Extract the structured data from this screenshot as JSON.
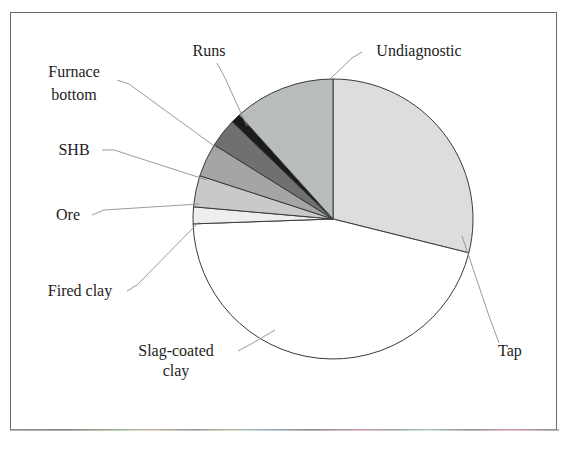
{
  "figure": {
    "border_color": "#6b6b6b",
    "background": "#ffffff"
  },
  "chart_data": {
    "type": "pie",
    "title": "",
    "subtitle": "",
    "xlabel": "",
    "ylabel": "",
    "legend_position": "none",
    "grid": false,
    "labels_outside": true,
    "center": {
      "x": 333,
      "y": 219
    },
    "radius": 140,
    "start_angle_deg": 0,
    "direction": "clockwise",
    "categories": [
      "Tap",
      "Slag-coated clay",
      "Fired clay",
      "Ore",
      "SHB",
      "Furnace bottom",
      "Runs",
      "Undiagnostic"
    ],
    "values": [
      28.9,
      45.6,
      1.9,
      3.6,
      3.9,
      3.3,
      1.1,
      11.7
    ],
    "value_unit": "percent",
    "slices": [
      {
        "label": "Tap",
        "value": 28.9,
        "start_deg": 0,
        "end_deg": 104,
        "color": "#dcdddd",
        "label_x": 510,
        "label_y": 356,
        "label_anchor": "middle",
        "leader": "M 499 343 L 489 316 L 462 236"
      },
      {
        "label": "Slag-coated clay",
        "value": 45.6,
        "start_deg": 104,
        "end_deg": 268,
        "color": "#ffffff",
        "label_x": 176,
        "label_y": 356,
        "label_anchor": "middle",
        "label_line2": "clay",
        "label2_x": 176,
        "label2_y": 376,
        "leader": "M 238 351 L 251 344 L 275 330"
      },
      {
        "label": "Fired clay",
        "value": 1.9,
        "start_deg": 268,
        "end_deg": 275,
        "color": "#eeeeee",
        "label_x": 80,
        "label_y": 296,
        "label_anchor": "middle",
        "leader": "M 127 291 L 137 285 L 199 222"
      },
      {
        "label": "Ore",
        "value": 3.6,
        "start_deg": 275,
        "end_deg": 288,
        "color": "#c8c9c9",
        "label_x": 68,
        "label_y": 220,
        "label_anchor": "middle",
        "leader": "M 92 215 L 104 210 L 199 204"
      },
      {
        "label": "SHB",
        "value": 3.9,
        "start_deg": 288,
        "end_deg": 302,
        "color": "#a3a5a6",
        "label_x": 74,
        "label_y": 155,
        "label_anchor": "middle",
        "leader": "M 102 150 L 114 150 L 207 180"
      },
      {
        "label": "Furnace bottom",
        "value": 3.3,
        "start_deg": 302,
        "end_deg": 314,
        "color": "#6e7071",
        "label_x": 74,
        "label_y": 77,
        "label_anchor": "middle",
        "label_line2": "bottom",
        "label2_x": 74,
        "label2_y": 100,
        "leader": "M 117 80 L 129 84 L 221 151"
      },
      {
        "label": "Runs",
        "value": 1.1,
        "start_deg": 314,
        "end_deg": 318,
        "color": "#1b1b1b",
        "label_x": 209,
        "label_y": 56,
        "label_anchor": "middle",
        "leader": "M 217 63 L 224 76 L 247 126"
      },
      {
        "label": "Undiagnostic",
        "value": 11.7,
        "start_deg": 318,
        "end_deg": 360,
        "color": "#b8bcbd",
        "label_x": 419,
        "label_y": 56,
        "label_anchor": "middle",
        "leader": "M 362 52 L 352 58 L 330 79"
      }
    ]
  }
}
